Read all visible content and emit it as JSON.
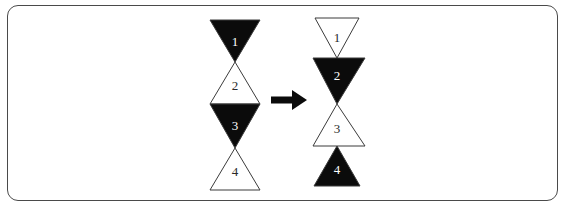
{
  "figure": {
    "frame": {
      "shape": "rounded-rectangle",
      "border_color": "#4a4a4a",
      "background_color": "#ffffff"
    },
    "arrow": {
      "direction": "right",
      "color": "#0b0b0b",
      "meaning": "transforms-into"
    },
    "colors": {
      "filled": "#0b0b0b",
      "unfilled": "#ffffff",
      "outline": "#3b3b3b",
      "label_on_filled": "#ffffff",
      "label_on_unfilled": "#2a2a2a"
    },
    "left_stack": {
      "name": "before",
      "triangles": [
        {
          "label": "1",
          "direction": "down",
          "fill": "black"
        },
        {
          "label": "2",
          "direction": "up",
          "fill": "white"
        },
        {
          "label": "3",
          "direction": "down",
          "fill": "black"
        },
        {
          "label": "4",
          "direction": "up",
          "fill": "white"
        }
      ]
    },
    "right_stack": {
      "name": "after",
      "triangles": [
        {
          "label": "1",
          "direction": "down",
          "fill": "white"
        },
        {
          "label": "2",
          "direction": "down",
          "fill": "black"
        },
        {
          "label": "3",
          "direction": "up",
          "fill": "white"
        },
        {
          "label": "4",
          "direction": "up",
          "fill": "black"
        }
      ]
    }
  }
}
